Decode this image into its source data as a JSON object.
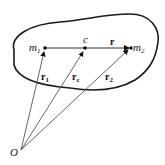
{
  "diagram": {
    "points": {
      "m1": {
        "label": "m",
        "sub": "1"
      },
      "c": {
        "label": "c"
      },
      "m2": {
        "label": "m",
        "sub": "2"
      },
      "origin": {
        "label": "O"
      }
    },
    "vectors": {
      "r": {
        "label": "r"
      },
      "r1": {
        "label": "r",
        "sub": "1"
      },
      "rc": {
        "label": "r",
        "sub": "c"
      },
      "r2": {
        "label": "r",
        "sub": "2"
      }
    },
    "colors": {
      "stroke": "#1a1a1a",
      "vector": "#555555",
      "background": "#ffffff"
    }
  }
}
